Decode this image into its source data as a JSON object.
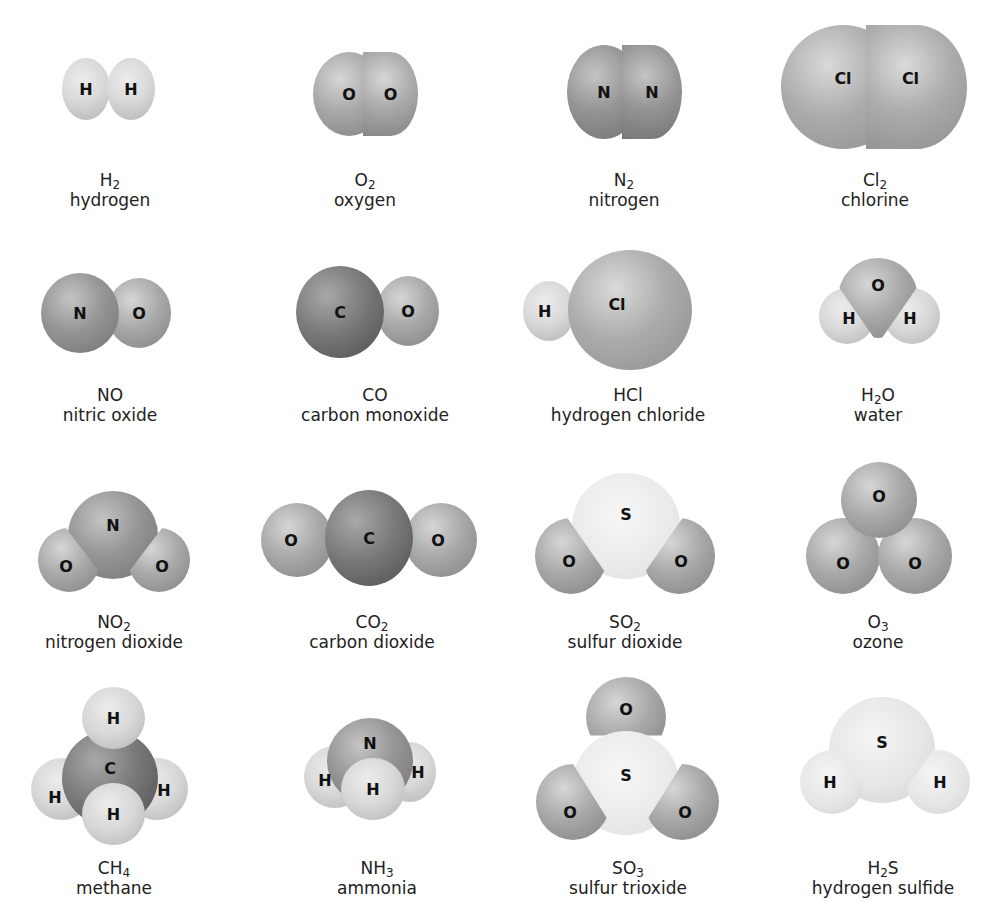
{
  "figure": {
    "molecules": [
      {
        "id": "h2",
        "formula": "H",
        "sub": "2",
        "formula_tail": "",
        "name": "hydrogen",
        "atoms": [
          "H",
          "H"
        ]
      },
      {
        "id": "o2",
        "formula": "O",
        "sub": "2",
        "formula_tail": "",
        "name": "oxygen",
        "atoms": [
          "O",
          "O"
        ]
      },
      {
        "id": "n2",
        "formula": "N",
        "sub": "2",
        "formula_tail": "",
        "name": "nitrogen",
        "atoms": [
          "N",
          "N"
        ]
      },
      {
        "id": "cl2",
        "formula": "Cl",
        "sub": "2",
        "formula_tail": "",
        "name": "chlorine",
        "atoms": [
          "Cl",
          "Cl"
        ]
      },
      {
        "id": "no",
        "formula": "NO",
        "sub": "",
        "formula_tail": "",
        "name": "nitric oxide",
        "atoms": [
          "N",
          "O"
        ]
      },
      {
        "id": "co",
        "formula": "CO",
        "sub": "",
        "formula_tail": "",
        "name": "carbon monoxide",
        "atoms": [
          "C",
          "O"
        ]
      },
      {
        "id": "hcl",
        "formula": "HCl",
        "sub": "",
        "formula_tail": "",
        "name": "hydrogen chloride",
        "atoms": [
          "H",
          "Cl"
        ]
      },
      {
        "id": "h2o",
        "formula": "H",
        "sub": "2",
        "formula_tail": "O",
        "name": "water",
        "atoms": [
          "O",
          "H",
          "H"
        ]
      },
      {
        "id": "no2",
        "formula": "NO",
        "sub": "2",
        "formula_tail": "",
        "name": "nitrogen dioxide",
        "atoms": [
          "N",
          "O",
          "O"
        ]
      },
      {
        "id": "co2",
        "formula": "CO",
        "sub": "2",
        "formula_tail": "",
        "name": "carbon dioxide",
        "atoms": [
          "O",
          "C",
          "O"
        ]
      },
      {
        "id": "so2",
        "formula": "SO",
        "sub": "2",
        "formula_tail": "",
        "name": "sulfur dioxide",
        "atoms": [
          "S",
          "O",
          "O"
        ]
      },
      {
        "id": "o3",
        "formula": "O",
        "sub": "3",
        "formula_tail": "",
        "name": "ozone",
        "atoms": [
          "O",
          "O",
          "O"
        ]
      },
      {
        "id": "ch4",
        "formula": "CH",
        "sub": "4",
        "formula_tail": "",
        "name": "methane",
        "atoms": [
          "H",
          "C",
          "H",
          "H",
          "H"
        ]
      },
      {
        "id": "nh3",
        "formula": "NH",
        "sub": "3",
        "formula_tail": "",
        "name": "ammonia",
        "atoms": [
          "N",
          "H",
          "H",
          "H"
        ]
      },
      {
        "id": "so3",
        "formula": "SO",
        "sub": "3",
        "formula_tail": "",
        "name": "sulfur trioxide",
        "atoms": [
          "O",
          "S",
          "O",
          "O"
        ]
      },
      {
        "id": "h2s",
        "formula": "H",
        "sub": "2",
        "formula_tail": "S",
        "name": "hydrogen sulfide",
        "atoms": [
          "S",
          "H",
          "H"
        ]
      }
    ]
  }
}
